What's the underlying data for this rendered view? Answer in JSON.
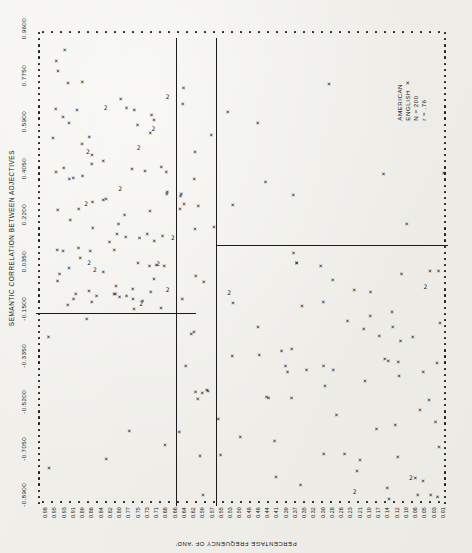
{
  "figure": {
    "x_axis_title": "SEMANTIC CORRELATION BETWEEN ADJECTIVES",
    "y_axis_title": "PERCENTAGE FREQUENCY OF 'AND'",
    "legend": {
      "line1": "AMERICAN",
      "line2": "ENGLISH",
      "line3": "N = 200",
      "line4": "r = .76"
    }
  },
  "chart_data": {
    "type": "scatter",
    "title": "",
    "xlabel": "SEMANTIC CORRELATION BETWEEN ADJECTIVES",
    "ylabel": "PERCENTAGE FREQUENCY OF 'AND'",
    "xlim": [
      -0.89,
      0.96
    ],
    "ylim": [
      0.0,
      0.98
    ],
    "grid": false,
    "legend_position": "right",
    "n": 200,
    "r": 0.76,
    "marker": "X",
    "overlap_marker": "2",
    "xticks": [
      -0.89,
      -0.705,
      -0.52,
      -0.335,
      -0.15,
      0.035,
      0.22,
      0.405,
      0.59,
      0.775,
      0.96
    ],
    "xticklabels": [
      "-0.8900",
      "-0.7050",
      "-0.5200",
      "-0.3350",
      "-0.1500",
      "0.0350",
      "0.2200",
      "0.4050",
      "0.5900",
      "0.7750",
      "0.9600"
    ],
    "yticklabels": [
      "0.98",
      "0.95",
      "0.93",
      "0.91",
      "0.89",
      "0.86",
      "0.84",
      "0.82",
      "0.80",
      "0.77",
      "0.75",
      "0.73",
      "0.71",
      "0.68",
      "0.66",
      "0.64",
      "0.62",
      "0.59",
      "0.57",
      "0.55",
      "0.53",
      "0.50",
      "0.48",
      "0.46",
      "0.44",
      "0.41",
      "0.39",
      "0.37",
      "0.35",
      "0.32",
      "0.30",
      "0.28",
      "0.26",
      "0.23",
      "0.21",
      "0.19",
      "0.17",
      "0.14",
      "0.12",
      "0.10",
      "0.08",
      "0.05",
      "0.03",
      "0.01"
    ],
    "partitions": [
      {
        "orientation": "vertical",
        "x": 0.295,
        "label": "vertical-divider-left"
      },
      {
        "orientation": "vertical",
        "x": 0.385,
        "label": "vertical-divider-right"
      },
      {
        "orientation": "horizontal",
        "y": 0.405,
        "x_from": -0.89,
        "x_to": 0.295,
        "label": "horizontal-divider-left"
      },
      {
        "orientation": "horizontal",
        "y": 0.545,
        "x_from": 0.385,
        "x_to": 0.96,
        "label": "horizontal-divider-right"
      }
    ],
    "points": [
      [
        -0.872,
        0.932
      ],
      [
        -0.866,
        0.908
      ],
      [
        -0.84,
        0.866
      ],
      [
        -0.812,
        0.873
      ],
      [
        -0.799,
        0.856
      ],
      [
        -0.775,
        0.789
      ],
      [
        -0.745,
        0.79
      ],
      [
        -0.75,
        0.736
      ],
      [
        -0.728,
        0.7
      ],
      [
        -0.705,
        0.672
      ],
      [
        -0.7,
        0.632
      ],
      [
        -0.682,
        0.61
      ],
      [
        -0.667,
        0.594
      ],
      [
        -0.648,
        0.576
      ],
      [
        -0.64,
        0.54
      ],
      [
        -0.631,
        0.52
      ],
      [
        -0.609,
        0.498
      ],
      [
        -0.601,
        0.465
      ],
      [
        -0.588,
        0.444
      ],
      [
        -0.57,
        0.43
      ],
      [
        -0.56,
        0.41
      ],
      [
        -0.548,
        0.392
      ],
      [
        -0.534,
        0.362
      ],
      [
        -0.52,
        0.345
      ],
      [
        -0.511,
        0.322
      ],
      [
        -0.498,
        0.31
      ],
      [
        -0.48,
        0.296
      ],
      [
        -0.463,
        0.281
      ],
      [
        -0.452,
        0.262
      ],
      [
        -0.438,
        0.248
      ],
      [
        -0.42,
        0.235
      ],
      [
        -0.401,
        0.222
      ],
      [
        -0.388,
        0.205
      ],
      [
        -0.37,
        0.193
      ],
      [
        -0.354,
        0.18
      ],
      [
        -0.338,
        0.168
      ],
      [
        -0.32,
        0.156
      ],
      [
        -0.302,
        0.144
      ],
      [
        -0.287,
        0.132
      ],
      [
        -0.271,
        0.12
      ],
      [
        -0.255,
        0.11
      ],
      [
        -0.238,
        0.099
      ],
      [
        -0.22,
        0.088
      ],
      [
        -0.204,
        0.079
      ],
      [
        -0.188,
        0.068
      ],
      [
        -0.17,
        0.059
      ],
      [
        -0.153,
        0.05
      ],
      [
        -0.137,
        0.041
      ],
      [
        -0.12,
        0.033
      ],
      [
        -0.104,
        0.026
      ],
      [
        -0.087,
        0.019
      ],
      [
        -0.07,
        0.014
      ],
      [
        -0.054,
        0.01
      ],
      [
        -0.038,
        0.007
      ],
      [
        -0.021,
        0.005
      ],
      [
        0.0,
        0.004
      ],
      [
        0.021,
        0.003
      ],
      [
        0.044,
        0.003
      ],
      [
        0.07,
        0.002
      ],
      [
        0.096,
        0.002
      ],
      [
        0.13,
        0.002
      ],
      [
        0.165,
        0.002
      ],
      [
        0.205,
        0.002
      ],
      [
        0.25,
        0.002
      ],
      [
        0.3,
        0.002
      ],
      [
        0.355,
        0.002
      ],
      [
        0.41,
        0.002
      ],
      [
        0.47,
        0.002
      ],
      [
        0.53,
        0.002
      ],
      [
        0.6,
        0.002
      ],
      [
        0.67,
        0.002
      ],
      [
        0.74,
        0.002
      ],
      [
        0.81,
        0.002
      ],
      [
        0.88,
        0.002
      ],
      [
        0.94,
        0.002
      ]
    ],
    "note": "Each plotted glyph is an X; a '2' glyph marks two coincident observations."
  }
}
